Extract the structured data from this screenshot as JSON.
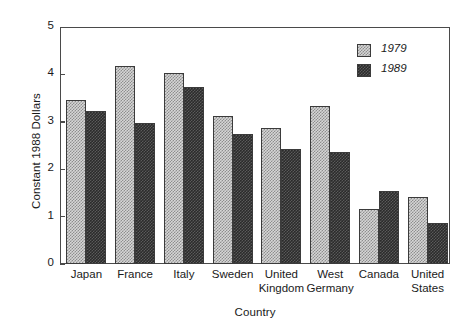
{
  "chart_data": {
    "type": "bar",
    "title": "",
    "xlabel": "Country",
    "ylabel": "Constant 1988 Dollars",
    "ylim": [
      0,
      5
    ],
    "yticks": [
      0,
      1,
      2,
      3,
      4,
      5
    ],
    "ytick_labels": [
      "0",
      "1",
      "2",
      "3",
      "4",
      "5"
    ],
    "grid": false,
    "legend_position": "top-right",
    "categories": [
      "Japan",
      "France",
      "Italy",
      "Sweden",
      "United Kingdom",
      "West Germany",
      "Canada",
      "United States"
    ],
    "category_lines": [
      [
        "Japan",
        ""
      ],
      [
        "France",
        ""
      ],
      [
        "Italy",
        ""
      ],
      [
        "Sweden",
        ""
      ],
      [
        "United",
        "Kingdom"
      ],
      [
        "West",
        "Germany"
      ],
      [
        "Canada",
        ""
      ],
      [
        "United",
        "States"
      ]
    ],
    "series": [
      {
        "name": "1979",
        "color": "#d6d6d6",
        "values": [
          3.45,
          4.17,
          4.03,
          3.12,
          2.88,
          3.33,
          1.17,
          1.41
        ]
      },
      {
        "name": "1989",
        "color": "#2b2b2b",
        "values": [
          3.22,
          2.97,
          3.74,
          2.74,
          2.43,
          2.37,
          1.55,
          0.87
        ]
      }
    ]
  },
  "legend": {
    "items": [
      {
        "label": "1979"
      },
      {
        "label": "1989"
      }
    ]
  },
  "axis_title_y": "Constant 1988 Dollars",
  "axis_title_x": "Country"
}
